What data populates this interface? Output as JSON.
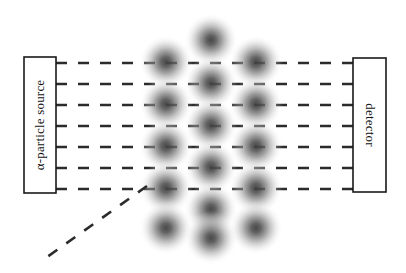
{
  "figure": {
    "type": "diagram",
    "background_color": "#ffffff",
    "width": 406,
    "height": 273
  },
  "source_box": {
    "label": "α-particle source",
    "x": 24,
    "y": 57,
    "width": 32,
    "height": 136,
    "stroke": "#1a1a1a",
    "fill": "#ffffff",
    "text_orientation": "vertical-bottom-to-top"
  },
  "detector_box": {
    "label": "detector",
    "x": 353,
    "y": 58,
    "width": 33,
    "height": 134,
    "stroke": "#1a1a1a",
    "fill": "#ffffff",
    "text_orientation": "vertical-top-to-bottom"
  },
  "rays": {
    "stroke": "#2b2b2b",
    "stroke_width": 2.6,
    "dash_pattern": "11 11",
    "count": 7,
    "x_start": 56,
    "x_end": 353,
    "y_positions": [
      63,
      84,
      105,
      126,
      147,
      168,
      189
    ]
  },
  "deflected_ray": {
    "stroke": "#2b2b2b",
    "stroke_width": 2.6,
    "dash_pattern": "11 11",
    "from_x": 147,
    "from_y": 186,
    "to_x": 40,
    "to_y": 262,
    "note": "single alpha particle scattered backward at a large angle"
  },
  "atoms": {
    "radius": 27,
    "core_color": "#4a4a4a",
    "edge_color": "#ffffff",
    "columns": [
      {
        "x": 166,
        "centers_y": [
          62,
          104,
          146,
          188,
          228
        ]
      },
      {
        "x": 211,
        "centers_y": [
          40,
          83,
          125,
          167,
          209,
          238
        ]
      },
      {
        "x": 256,
        "centers_y": [
          62,
          104,
          146,
          188,
          228
        ]
      }
    ],
    "positions": [
      {
        "cx": 166,
        "cy": 62
      },
      {
        "cx": 166,
        "cy": 104
      },
      {
        "cx": 166,
        "cy": 146
      },
      {
        "cx": 166,
        "cy": 188
      },
      {
        "cx": 166,
        "cy": 228
      },
      {
        "cx": 211,
        "cy": 40
      },
      {
        "cx": 211,
        "cy": 83
      },
      {
        "cx": 211,
        "cy": 125
      },
      {
        "cx": 211,
        "cy": 167
      },
      {
        "cx": 211,
        "cy": 209
      },
      {
        "cx": 211,
        "cy": 238
      },
      {
        "cx": 256,
        "cy": 62
      },
      {
        "cx": 256,
        "cy": 104
      },
      {
        "cx": 256,
        "cy": 146
      },
      {
        "cx": 256,
        "cy": 188
      },
      {
        "cx": 256,
        "cy": 228
      }
    ]
  }
}
